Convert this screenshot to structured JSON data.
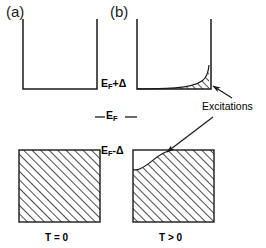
{
  "figure": {
    "panels": [
      {
        "key": "a",
        "label": "(a)",
        "temperature_label": "T = 0",
        "description": "Zero temperature: states below E_F-Δ fully occupied, states above E_F+Δ completely empty"
      },
      {
        "key": "b",
        "label": "(b)",
        "temperature_label": "T > 0",
        "description": "Finite temperature: thermal excitations partially fill the upper band and deplete the lower band"
      }
    ],
    "energy_levels": [
      {
        "key": "upper",
        "text_main": "E",
        "text_sub": "F",
        "text_tail": "+Δ"
      },
      {
        "key": "fermi",
        "text_main": "E",
        "text_sub": "F",
        "text_tail": ""
      },
      {
        "key": "lower",
        "text_main": "E",
        "text_sub": "F",
        "text_tail": "-Δ"
      }
    ],
    "annotation": {
      "label": "Excitations"
    },
    "colors": {
      "stroke": "#1a1a1a",
      "hatch": "#2b2b2b",
      "background": "#ffffff",
      "text": "#000000"
    }
  }
}
